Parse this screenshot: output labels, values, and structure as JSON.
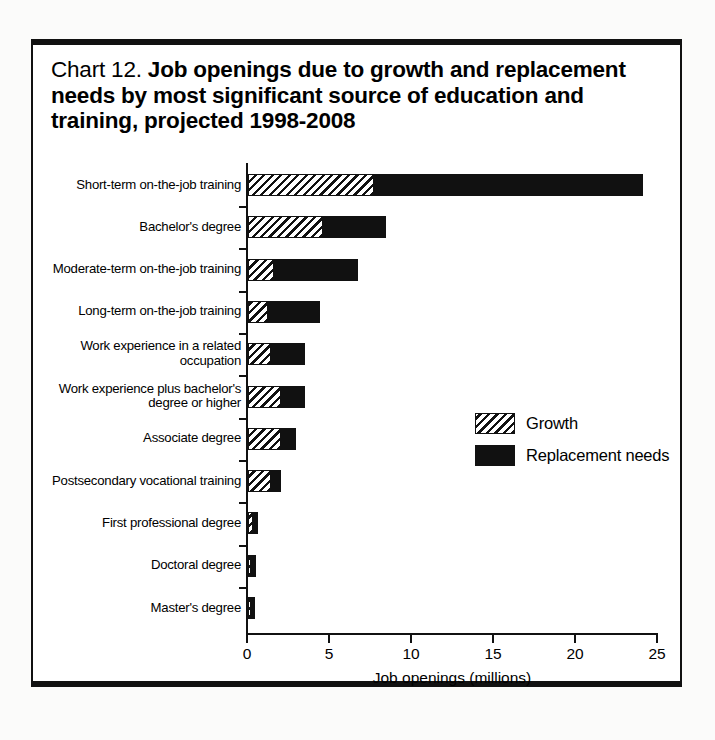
{
  "figure": {
    "number_label": "Chart 12.",
    "title": "Job openings due to growth and replacement needs by most significant source of education and training, projected 1998-2008",
    "frame_color": "#111111",
    "background": "#ffffff"
  },
  "chart_data": {
    "type": "bar",
    "orientation": "horizontal",
    "stacked": true,
    "title": "Chart 12. Job openings due to growth and replacement needs by most significant source of education and training, projected 1998-2008",
    "xlabel": "Job openings (millions)",
    "ylabel": "",
    "xlim": [
      0,
      25
    ],
    "xticks": [
      0,
      5,
      10,
      15,
      20,
      25
    ],
    "xtick_labels": [
      "0",
      "5",
      "10",
      "15",
      "20",
      "25"
    ],
    "grid": false,
    "legend_position": "center-right",
    "categories": [
      "Short-term on-the-job training",
      "Bachelor's degree",
      "Moderate-term on-the-job training",
      "Long-term on-the-job training",
      "Work experience in a related occupation",
      "Work experience plus bachelor's degree or higher",
      "Associate degree",
      "Postsecondary vocational training",
      "First professional degree",
      "Doctoral degree",
      "Master's degree"
    ],
    "series": [
      {
        "name": "Growth",
        "fill": "hatched",
        "color": "#111111",
        "values": [
          7.7,
          4.6,
          1.6,
          1.2,
          1.4,
          2.0,
          2.0,
          1.4,
          0.3,
          0.2,
          0.2
        ]
      },
      {
        "name": "Replacement needs",
        "fill": "solid",
        "color": "#111111",
        "values": [
          16.4,
          3.8,
          5.1,
          3.2,
          2.1,
          1.5,
          0.9,
          0.6,
          0.3,
          0.3,
          0.2
        ]
      }
    ],
    "totals": [
      24.1,
      8.4,
      6.7,
      4.4,
      3.5,
      3.5,
      2.9,
      2.0,
      0.6,
      0.5,
      0.4
    ]
  },
  "legend": {
    "items": [
      {
        "label": "Growth",
        "swatch": "hatched"
      },
      {
        "label": "Replacement needs",
        "swatch": "solid"
      }
    ]
  },
  "axis": {
    "x_title": "Job openings (millions)"
  }
}
